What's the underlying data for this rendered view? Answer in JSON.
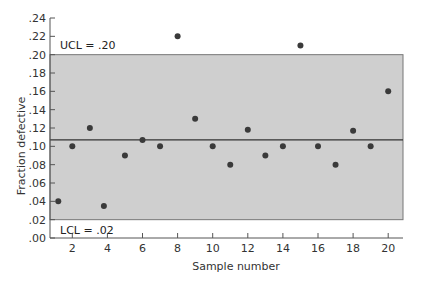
{
  "chart_data": {
    "type": "scatter",
    "title": "",
    "xlabel": "Sample number",
    "ylabel": "Fraction defective",
    "xlim": [
      0.6,
      20.9
    ],
    "ylim": [
      0.0,
      0.24
    ],
    "x_ticks": [
      2,
      4,
      6,
      8,
      10,
      12,
      14,
      16,
      18,
      20
    ],
    "x_tick_labels": [
      "2",
      "4",
      "6",
      "8",
      "10",
      "12",
      "14",
      "16",
      "18",
      "20"
    ],
    "y_ticks": [
      0.0,
      0.02,
      0.04,
      0.06,
      0.08,
      0.1,
      0.12,
      0.14,
      0.16,
      0.18,
      0.2,
      0.22,
      0.24
    ],
    "y_tick_labels": [
      ".00",
      ".02",
      ".04",
      ".06",
      ".08",
      ".10",
      ".12",
      ".14",
      ".16",
      ".18",
      ".20",
      ".22",
      ".24"
    ],
    "grid": false,
    "series": [
      {
        "name": "Fraction defective",
        "x": [
          1.2,
          2,
          3,
          3.8,
          5,
          6,
          7,
          8,
          9,
          10,
          11,
          12,
          13,
          14,
          15,
          16,
          17,
          18,
          19,
          20
        ],
        "values": [
          0.04,
          0.1,
          0.12,
          0.035,
          0.09,
          0.107,
          0.1,
          0.22,
          0.13,
          0.1,
          0.08,
          0.118,
          0.09,
          0.1,
          0.21,
          0.1,
          0.08,
          0.117,
          0.1,
          0.16
        ]
      }
    ],
    "control_limits": {
      "ucl": 0.2,
      "center": 0.107,
      "lcl": 0.02,
      "ucl_label": "UCL = .20",
      "lcl_label": "LCL = .02"
    },
    "annotations": [
      "UCL = .20",
      "LCL = .02"
    ],
    "colors": {
      "band_fill": "#cfcfcf",
      "point": "#3a3a3a",
      "axis": "#555555",
      "center_line": "#333333"
    }
  }
}
